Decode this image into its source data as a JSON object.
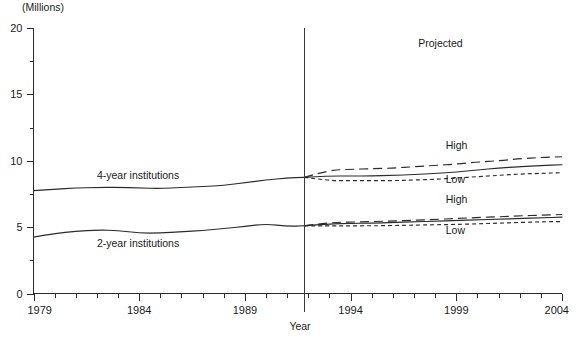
{
  "figure": {
    "unit_label": "(Millions)",
    "xaxis_title": "Year",
    "clipped_title": "",
    "projected_label": "Projected",
    "series_label_4yr": "4-year institutions",
    "series_label_2yr": "2-year institutions",
    "high_label_4yr": "High",
    "low_label_4yr": "Low",
    "high_label_2yr": "High",
    "low_label_2yr": "Low",
    "line_color": "#2b2b2b",
    "background_color": "#ffffff"
  },
  "chart_data": {
    "type": "line",
    "title": "",
    "subtitle": "",
    "xlabel": "Year",
    "ylabel": "(Millions)",
    "xlim": [
      1979,
      2004
    ],
    "ylim": [
      0,
      20
    ],
    "ytick_step_major": 5,
    "ytick_step_minor": 2.5,
    "xtick_step_major": 5,
    "xtick_step_minor": 1,
    "grid": false,
    "legend_position": "inline-annotations",
    "xticklabels": [
      "1979",
      "1984",
      "1989",
      "1994",
      "1999",
      "2004"
    ],
    "yticklabels": [
      "0",
      "5",
      "10",
      "15",
      "20"
    ],
    "projection_divider_year": 1991.8,
    "annotations": [
      {
        "text": "Projected",
        "x": 1997.2,
        "y": 18.6
      },
      {
        "text": "4-year institutions",
        "x": 1982.0,
        "y": 8.6
      },
      {
        "text": "2-year institutions",
        "x": 1982.0,
        "y": 3.5
      },
      {
        "text": "High",
        "x": 1998.5,
        "y": 10.9
      },
      {
        "text": "Low",
        "x": 1998.5,
        "y": 8.3
      },
      {
        "text": "High",
        "x": 1998.5,
        "y": 6.8
      },
      {
        "text": "Low",
        "x": 1998.5,
        "y": 4.5
      }
    ],
    "series": [
      {
        "name": "4-year institutions actual",
        "style": "solid",
        "segment": "historical",
        "x": [
          1979,
          1980,
          1981,
          1982,
          1983,
          1984,
          1985,
          1986,
          1987,
          1988,
          1989,
          1990,
          1991,
          1991.8
        ],
        "values": [
          7.75,
          7.85,
          7.95,
          7.98,
          8.0,
          7.95,
          7.9,
          8.0,
          8.05,
          8.15,
          8.35,
          8.55,
          8.7,
          8.75
        ]
      },
      {
        "name": "4-year institutions middle projection",
        "style": "solid",
        "segment": "projected",
        "x": [
          1991.8,
          1993,
          1994,
          1995,
          1996,
          1997,
          1998,
          1999,
          2000,
          2001,
          2002,
          2003,
          2004
        ],
        "values": [
          8.75,
          8.85,
          8.85,
          8.85,
          8.9,
          8.95,
          9.05,
          9.15,
          9.3,
          9.45,
          9.55,
          9.65,
          9.7
        ]
      },
      {
        "name": "4-year institutions high projection",
        "style": "dashed-long",
        "segment": "projected",
        "x": [
          1991.8,
          1993,
          1994,
          1995,
          1996,
          1997,
          1998,
          1999,
          2000,
          2001,
          2002,
          2003,
          2004
        ],
        "values": [
          8.75,
          9.3,
          9.35,
          9.4,
          9.45,
          9.55,
          9.65,
          9.75,
          9.9,
          10.0,
          10.15,
          10.25,
          10.3
        ]
      },
      {
        "name": "4-year institutions low projection",
        "style": "dashed-short",
        "segment": "projected",
        "x": [
          1991.8,
          1993,
          1994,
          1995,
          1996,
          1997,
          1998,
          1999,
          2000,
          2001,
          2002,
          2003,
          2004
        ],
        "values": [
          8.75,
          8.5,
          8.5,
          8.5,
          8.5,
          8.55,
          8.6,
          8.7,
          8.8,
          8.9,
          9.0,
          9.05,
          9.1
        ]
      },
      {
        "name": "2-year institutions actual",
        "style": "solid",
        "segment": "historical",
        "x": [
          1979,
          1980,
          1981,
          1982,
          1983,
          1984,
          1985,
          1986,
          1987,
          1988,
          1989,
          1990,
          1991,
          1991.8
        ],
        "values": [
          4.25,
          4.5,
          4.7,
          4.78,
          4.75,
          4.55,
          4.55,
          4.65,
          4.75,
          4.9,
          5.05,
          5.25,
          5.05,
          5.1
        ]
      },
      {
        "name": "2-year institutions middle projection",
        "style": "solid",
        "segment": "projected",
        "x": [
          1991.8,
          1993,
          1994,
          1995,
          1996,
          1997,
          1998,
          1999,
          2000,
          2001,
          2002,
          2003,
          2004
        ],
        "values": [
          5.1,
          5.25,
          5.28,
          5.3,
          5.35,
          5.4,
          5.45,
          5.5,
          5.55,
          5.6,
          5.65,
          5.7,
          5.75
        ]
      },
      {
        "name": "2-year institutions high projection",
        "style": "dashed-long",
        "segment": "projected",
        "x": [
          1991.8,
          1993,
          1994,
          1995,
          1996,
          1997,
          1998,
          1999,
          2000,
          2001,
          2002,
          2003,
          2004
        ],
        "values": [
          5.1,
          5.35,
          5.38,
          5.42,
          5.46,
          5.52,
          5.58,
          5.65,
          5.72,
          5.78,
          5.85,
          5.9,
          5.95
        ]
      },
      {
        "name": "2-year institutions low projection",
        "style": "dashed-short",
        "segment": "projected",
        "x": [
          1991.8,
          1993,
          1994,
          1995,
          1996,
          1997,
          1998,
          1999,
          2000,
          2001,
          2002,
          2003,
          2004
        ],
        "values": [
          5.1,
          5.1,
          5.1,
          5.1,
          5.12,
          5.15,
          5.18,
          5.2,
          5.25,
          5.3,
          5.35,
          5.4,
          5.42
        ]
      }
    ]
  }
}
